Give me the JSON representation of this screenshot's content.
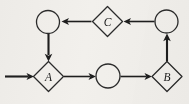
{
  "diagram": {
    "background_color": "#f2f0ec",
    "stroke_color": "#1e1e1e",
    "label_color": "#1b1b1b",
    "nodes": [
      {
        "id": "circle-top-left",
        "shape": "circle",
        "label": "",
        "cx": 48,
        "cy": 22,
        "r": 11.5
      },
      {
        "id": "diamond-c",
        "shape": "diamond",
        "label": "C",
        "cx": 107.5,
        "cy": 21.5,
        "rx": 15,
        "ry": 15
      },
      {
        "id": "circle-top-right",
        "shape": "circle",
        "label": "",
        "cx": 166.5,
        "cy": 21.5,
        "r": 11.5
      },
      {
        "id": "diamond-a",
        "shape": "diamond",
        "label": "A",
        "cx": 48.5,
        "cy": 76.5,
        "rx": 15,
        "ry": 15
      },
      {
        "id": "circle-middle",
        "shape": "circle",
        "label": "",
        "cx": 108,
        "cy": 76,
        "r": 12
      },
      {
        "id": "diamond-b",
        "shape": "diamond",
        "label": "B",
        "cx": 167,
        "cy": 76.5,
        "rx": 15,
        "ry": 15
      }
    ],
    "edges": [
      {
        "id": "edge-input-to-a",
        "from": "input",
        "to": "diamond-a",
        "direction": "right",
        "x1": 5,
        "y1": 76.5,
        "x2": 33,
        "y2": 76.5
      },
      {
        "id": "edge-a-to-circle-middle",
        "from": "diamond-a",
        "to": "circle-middle",
        "direction": "right",
        "x1": 64,
        "y1": 76.5,
        "x2": 95,
        "y2": 76.5
      },
      {
        "id": "edge-circle-middle-to-b",
        "from": "circle-middle",
        "to": "diamond-b",
        "direction": "right",
        "x1": 121,
        "y1": 76.5,
        "x2": 151,
        "y2": 76.5
      },
      {
        "id": "edge-b-to-circle-top-right",
        "from": "diamond-b",
        "to": "circle-top-right",
        "direction": "up",
        "x1": 167,
        "y1": 61,
        "x2": 167,
        "y2": 34
      },
      {
        "id": "edge-circle-top-right-to-c",
        "from": "circle-top-right",
        "to": "diamond-c",
        "direction": "left",
        "x1": 154,
        "y1": 21.5,
        "x2": 124,
        "y2": 21.5
      },
      {
        "id": "edge-c-to-circle-top-left",
        "from": "diamond-c",
        "to": "circle-top-left",
        "direction": "left",
        "x1": 91,
        "y1": 21.5,
        "x2": 61.5,
        "y2": 21.5
      },
      {
        "id": "edge-circle-top-left-to-a",
        "from": "circle-top-left",
        "to": "diamond-a",
        "direction": "down",
        "x1": 48.5,
        "y1": 34,
        "x2": 48.5,
        "y2": 60
      }
    ]
  }
}
